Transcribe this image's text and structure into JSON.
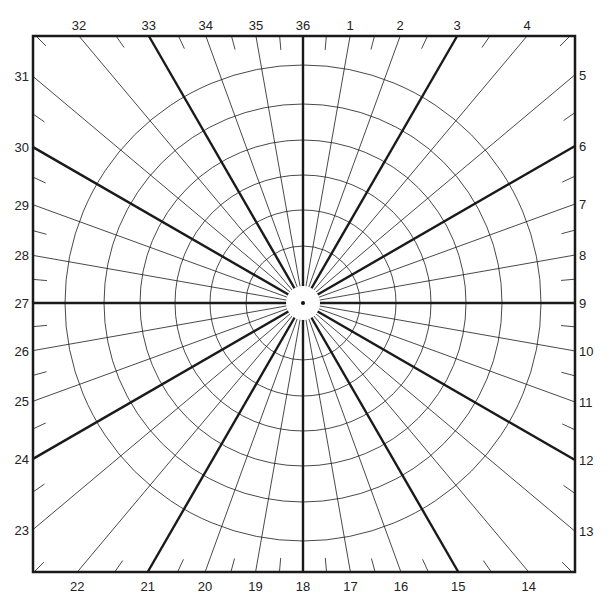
{
  "diagram": {
    "type": "polar-grid",
    "frame": {
      "left": 33,
      "top": 36,
      "right": 575,
      "bottom": 572
    },
    "center": {
      "x": 303,
      "y": 303
    },
    "hole_radius": 17,
    "circle_radii": [
      57,
      93,
      128,
      163,
      199,
      238
    ],
    "ray_step_deg": 10,
    "bold_ray_every_deg": 30,
    "tick_step_deg": 5,
    "line_color": "#1a1a1a",
    "labels": [
      {
        "n": "1"
      },
      {
        "n": "2"
      },
      {
        "n": "3"
      },
      {
        "n": "4"
      },
      {
        "n": "5"
      },
      {
        "n": "6"
      },
      {
        "n": "7"
      },
      {
        "n": "8"
      },
      {
        "n": "9"
      },
      {
        "n": "10"
      },
      {
        "n": "11"
      },
      {
        "n": "12"
      },
      {
        "n": "13"
      },
      {
        "n": "14"
      },
      {
        "n": "15"
      },
      {
        "n": "16"
      },
      {
        "n": "17"
      },
      {
        "n": "18"
      },
      {
        "n": "19"
      },
      {
        "n": "20"
      },
      {
        "n": "21"
      },
      {
        "n": "22"
      },
      {
        "n": "23"
      },
      {
        "n": "24"
      },
      {
        "n": "25"
      },
      {
        "n": "26"
      },
      {
        "n": "27"
      },
      {
        "n": "28"
      },
      {
        "n": "29"
      },
      {
        "n": "30"
      },
      {
        "n": "31"
      },
      {
        "n": "32"
      },
      {
        "n": "33"
      },
      {
        "n": "34"
      },
      {
        "n": "35"
      },
      {
        "n": "36"
      }
    ]
  }
}
